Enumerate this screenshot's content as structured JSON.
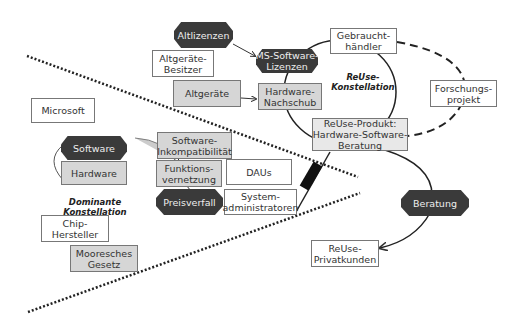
{
  "nodes": {
    "altlizenzen": "Altlizenzen",
    "ms_software_lizenzen": "MS-Software-\nLizenzen",
    "gebrauchthaendler": "Gebraucht-\nhändler",
    "altgeraete_besitzer": "Altgeräte-\nBesitzer",
    "altgeraete": "Altgeräte",
    "hardware_nachschub": "Hardware-\nNachschub",
    "forschungsprojekt": "Forschungs-\nprojekt",
    "reuse_produkt": "ReUse-Produkt:\nHardware-Software-\nBeratung",
    "microsoft": "Microsoft",
    "software": "Software",
    "hardware": "Hardware",
    "software_inkompatibilitaet": "Software-\nInkompatibilität",
    "funktionsvernetzung": "Funktions-\nvernetzung",
    "daus": "DAUs",
    "preisverfall": "Preisverfall",
    "systemadministratoren": "System-\nadministratoren",
    "chip_hersteller": "Chip-\nHersteller",
    "mooresches_gesetz": "Mooresches\nGesetz",
    "beratung": "Beratung",
    "reuse_privatkunden": "ReUse-\nPrivatkunden"
  },
  "labels": {
    "reuse_konstellation": "ReUse-\nKonstellation",
    "dominante_konstellation": "Dominante Konstellation"
  },
  "colors": {
    "dark_fill": "#3a3a3a",
    "light_fill": "#d6d6d6",
    "box_border": "#777777",
    "line": "#222222"
  }
}
